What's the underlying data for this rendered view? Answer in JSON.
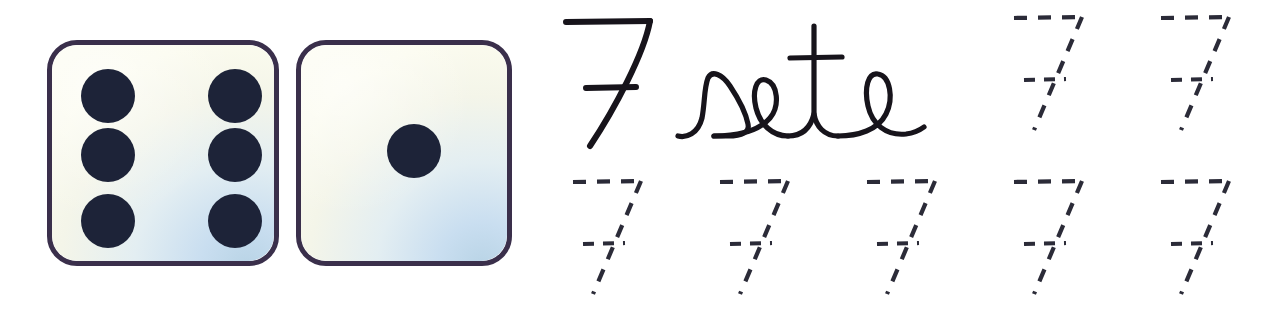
{
  "worksheet": {
    "title": "Number seven tracing worksheet",
    "number_value": 7,
    "number_glyph": "7",
    "number_word": "sete",
    "language_note": "cursive handwriting model",
    "ink_color": "#17141b",
    "dash_color": "#2b2b38",
    "background_color": "#ffffff"
  },
  "dice": {
    "group_name": "dice-pair",
    "total_pips": 7,
    "items": [
      {
        "name": "die-six",
        "value": 6,
        "face_label": "6",
        "border_color": "#3a2f4b",
        "face_color": "#fbfbee",
        "shade_color": "#b9d4e6",
        "pip_color": "#1d2338",
        "pips": [
          {
            "name": "pip-top-left",
            "cx": 55,
            "cy": 50
          },
          {
            "name": "pip-middle-left",
            "cx": 55,
            "cy": 110
          },
          {
            "name": "pip-bottom-left",
            "cx": 55,
            "cy": 176
          },
          {
            "name": "pip-top-right",
            "cx": 182,
            "cy": 50
          },
          {
            "name": "pip-middle-right",
            "cx": 182,
            "cy": 110
          },
          {
            "name": "pip-bottom-right",
            "cx": 182,
            "cy": 176
          }
        ]
      },
      {
        "name": "die-one",
        "value": 1,
        "face_label": "1",
        "border_color": "#3a2f4b",
        "face_color": "#fbfbee",
        "shade_color": "#b9d4e6",
        "pip_color": "#1d2338",
        "pips": [
          {
            "name": "pip-center",
            "cx": 113,
            "cy": 106
          }
        ]
      }
    ]
  },
  "model_row": {
    "name": "model-row",
    "numeral": {
      "name": "model-numeral-7",
      "label": "7",
      "crossed": true
    },
    "word": {
      "name": "model-word-sete",
      "label": "sete"
    }
  },
  "tracing": {
    "name": "tracing-grid",
    "style": "dashed",
    "glyph": "7",
    "crossed": true,
    "rows": [
      {
        "name": "tracing-row-top",
        "slots": [
          {
            "name": "trace-7-r1c1",
            "label": "7"
          },
          {
            "name": "trace-7-r1c2",
            "label": "7"
          }
        ]
      },
      {
        "name": "tracing-row-bottom",
        "slots": [
          {
            "name": "trace-7-r2c1",
            "label": "7"
          },
          {
            "name": "trace-7-r2c2",
            "label": "7"
          },
          {
            "name": "trace-7-r2c3",
            "label": "7"
          },
          {
            "name": "trace-7-r2c4",
            "label": "7"
          },
          {
            "name": "trace-7-r2c5",
            "label": "7"
          }
        ]
      }
    ]
  }
}
